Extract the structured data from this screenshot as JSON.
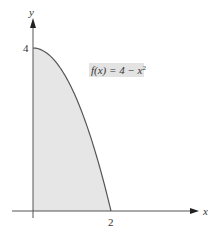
{
  "chart_data": {
    "type": "area",
    "title": "",
    "function": "f(x) = 4 - x^2",
    "annotation": {
      "text_prefix": "f(x) = 4 − x",
      "superscript": "2"
    },
    "xlabel": "x",
    "ylabel": "y",
    "x_ticks": [
      {
        "value": 2,
        "label": "2"
      }
    ],
    "y_ticks": [
      {
        "value": 4,
        "label": "4"
      }
    ],
    "xlim": [
      -0.55,
      4.3
    ],
    "ylim": [
      -0.15,
      5.1
    ],
    "grid": false,
    "legend": null,
    "shaded_region": {
      "from_x": 0,
      "to_x": 2,
      "under": "f(x) = 4 - x^2",
      "color": "#e6e6e6"
    },
    "series": [
      {
        "name": "f(x) = 4 - x^2",
        "x": [
          0,
          0.25,
          0.5,
          0.75,
          1.0,
          1.25,
          1.5,
          1.75,
          2.0
        ],
        "y": [
          4,
          3.9375,
          3.75,
          3.4375,
          3.0,
          2.4375,
          1.75,
          0.9375,
          0
        ]
      }
    ],
    "colors": {
      "curve": "#555555",
      "axis": "#555555",
      "fill": "#e6e6e6",
      "label_bg": "#e3e3e3"
    }
  }
}
